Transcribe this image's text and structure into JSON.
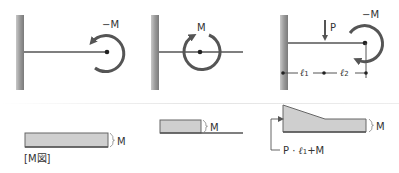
{
  "colors": {
    "line": "#555555",
    "wall_dark": "#8a8a8a",
    "wall_light": "#c8c8c8",
    "fill": "#cfcfcf",
    "text": "#333333",
    "separator": "#e6e6e6"
  },
  "top_row": [
    {
      "id": "case1",
      "moment_label": "−M",
      "rotation": "counterclockwise"
    },
    {
      "id": "case2",
      "moment_label": "M",
      "rotation": "clockwise"
    },
    {
      "id": "case3",
      "moment_label": "−M",
      "load_label": "P",
      "dim_labels": {
        "l1": "ℓ",
        "l1_sub": "1",
        "l2": "ℓ",
        "l2_sub": "2"
      }
    }
  ],
  "bottom_row": [
    {
      "id": "mdiagram1",
      "value_label": "M",
      "caption": "[M図]"
    },
    {
      "id": "mdiagram2",
      "value_label": "M"
    },
    {
      "id": "mdiagram3",
      "value_label": "M",
      "peak_label_prefix": "P · ",
      "peak_label_l": "ℓ",
      "peak_label_sub": "1",
      "peak_label_suffix": "+M"
    }
  ]
}
